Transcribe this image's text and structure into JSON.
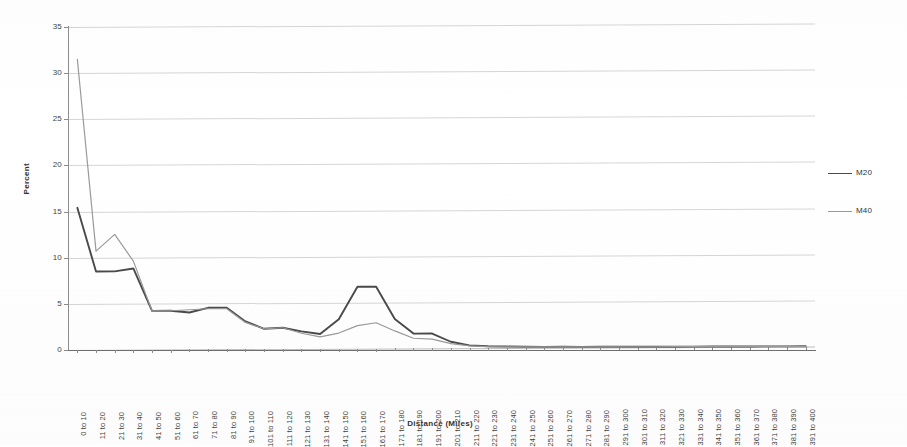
{
  "chart_data": {
    "type": "line",
    "title": "",
    "xlabel": "Distance (Miles)",
    "ylabel": "Percent",
    "ylim": [
      0,
      35
    ],
    "ytick_step": 5,
    "yticks": [
      "0",
      "5",
      "10",
      "15",
      "20",
      "25",
      "30",
      "35"
    ],
    "grid": true,
    "legend_position": "right",
    "categories": [
      "0 to 10",
      "11 to 20",
      "21 to 30",
      "31 to 40",
      "41 to 50",
      "51 to 60",
      "61 to 70",
      "71 to 80",
      "81 to 90",
      "91 to 100",
      "101 to 110",
      "111 to 120",
      "121 to 130",
      "131 to 140",
      "141 to 150",
      "151 to 160",
      "161 to 170",
      "171 to 180",
      "181 to 190",
      "191 to 200",
      "201 to 210",
      "211 to 220",
      "221 to 230",
      "231 to 240",
      "241 to 250",
      "251 to 260",
      "261 to 270",
      "271 to 280",
      "281 to 290",
      "291 to 300",
      "301 to 310",
      "311 to 320",
      "321 to 330",
      "331 to 340",
      "341 to 350",
      "351 to 360",
      "361 to 370",
      "371 to 380",
      "381 to 390",
      "391 to 400"
    ],
    "series": [
      {
        "name": "M20",
        "color": "#4a4a4a",
        "width": 1.9,
        "values": [
          15.4,
          8.5,
          8.5,
          8.8,
          4.2,
          4.2,
          4.0,
          4.5,
          4.5,
          3.0,
          2.2,
          2.3,
          1.9,
          1.6,
          3.2,
          6.7,
          6.7,
          3.2,
          1.6,
          1.6,
          0.7,
          0.3,
          0.2,
          0.15,
          0.12,
          0.1,
          0.1,
          0.08,
          0.08,
          0.07,
          0.06,
          0.06,
          0.05,
          0.05,
          0.05,
          0.04,
          0.04,
          0.04,
          0.03,
          0.03
        ]
      },
      {
        "name": "M40",
        "color": "#9a9a9a",
        "width": 1.2,
        "values": [
          31.5,
          10.7,
          12.5,
          9.6,
          4.2,
          4.2,
          4.3,
          4.4,
          4.4,
          2.9,
          2.2,
          2.3,
          1.7,
          1.3,
          1.7,
          2.5,
          2.8,
          1.9,
          1.1,
          1.0,
          0.5,
          0.25,
          0.15,
          0.12,
          0.1,
          0.09,
          0.08,
          0.07,
          0.07,
          0.06,
          0.05,
          0.05,
          0.05,
          0.04,
          0.04,
          0.04,
          0.03,
          0.03,
          0.03,
          0.02
        ]
      }
    ]
  },
  "legend": {
    "items": [
      {
        "label": "M20",
        "color": "#4a4a4a",
        "width": "1.9px"
      },
      {
        "label": "M40",
        "color": "#9a9a9a",
        "width": "1.2px"
      }
    ]
  },
  "axes": {
    "x_title": "Distance (Miles)",
    "y_title": "Percent"
  }
}
